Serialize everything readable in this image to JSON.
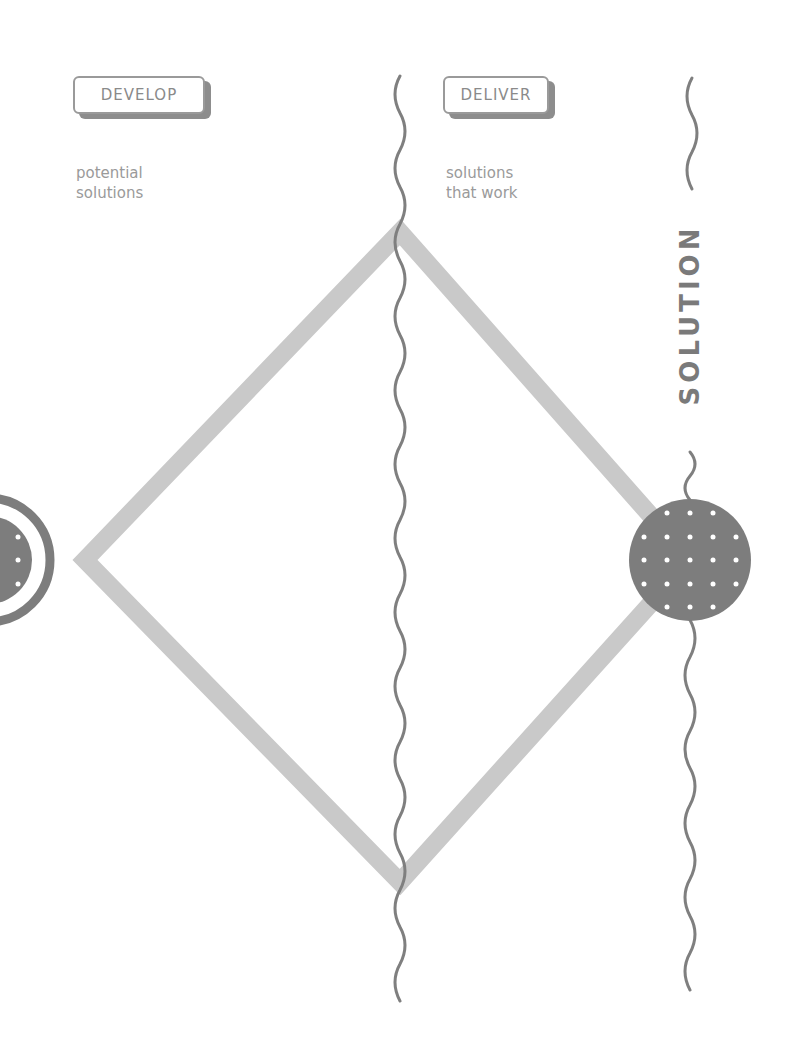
{
  "phases": [
    {
      "id": "develop",
      "label": "DEVELOP",
      "description_lines": [
        "potential",
        "solutions"
      ]
    },
    {
      "id": "deliver",
      "label": "DELIVER",
      "description_lines": [
        "solutions",
        "that work"
      ]
    }
  ],
  "outcome": {
    "label": "SOLUTION"
  },
  "colors": {
    "diamond_stroke": "#c9c9c9",
    "wave_line": "#7f7f7f",
    "circle_fill": "#7d7d7d",
    "dot": "#ffffff",
    "box_border": "#9a9a9a",
    "text": "#8a8a8a"
  },
  "shapes": {
    "diamond": {
      "left": [
        85,
        560
      ],
      "top": [
        400,
        232
      ],
      "right": [
        690,
        560
      ],
      "bottom": [
        400,
        882
      ]
    },
    "solution_circle": {
      "cx": 690,
      "cy": 560,
      "r": 61,
      "dot_grid": "5x5 minus corners"
    },
    "problem_circle_partial": {
      "cx": -10,
      "cy": 560,
      "inner_r": 45,
      "ring_r": 62
    }
  }
}
